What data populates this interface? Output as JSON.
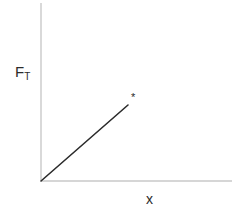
{
  "figure": {
    "title": "",
    "background_color": "#ffffff",
    "width": 239,
    "height": 222
  },
  "axes": {
    "y_axis": {
      "label": "F",
      "label_subscript": "T",
      "color": "#c9c9c9",
      "x_px": 41,
      "y_top_px": 3,
      "y_bottom_px": 181
    },
    "x_axis": {
      "label": "x",
      "color": "#c9c9c9",
      "y_px": 181,
      "x_left_px": 41,
      "x_right_px": 232
    }
  },
  "annotations": {
    "asterisk": "*"
  },
  "chart_data": {
    "type": "line",
    "title": "",
    "xlabel": "x",
    "ylabel": "F_T",
    "grid": false,
    "legend": null,
    "axis_ticks": {
      "x": [],
      "y": []
    },
    "xlim": [
      0,
      1
    ],
    "ylim": [
      0,
      1
    ],
    "series": [
      {
        "name": "F_T vs x",
        "color": "#2b2b2b",
        "linewidth": 1.6,
        "x": [
          0,
          1
        ],
        "y": [
          0,
          1
        ],
        "points_px": [
          {
            "x": 41,
            "y": 181
          },
          {
            "x": 128,
            "y": 105
          }
        ]
      }
    ],
    "markers": [
      {
        "name": "asterisk-marker",
        "symbol": "*",
        "color": "#2b2b2b",
        "x_px": 134,
        "y_px": 97
      }
    ]
  }
}
